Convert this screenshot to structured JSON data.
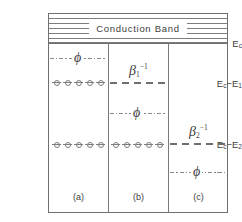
{
  "figure": {
    "type": "energy-band-diagram",
    "conduction_band_label": "Conduction Band",
    "axis_labels": [
      {
        "id": "ec",
        "text": "E",
        "sub": "c",
        "full": "E_c"
      },
      {
        "id": "ec_e1",
        "text": "E",
        "sub": "c",
        "full": "E_c - E_1",
        "minus": "−",
        "t2": "E",
        "sub2": "1"
      },
      {
        "id": "ec_e2",
        "text": "E",
        "sub": "c",
        "full": "E_c - E_2",
        "minus": "−",
        "t2": "E",
        "sub2": "2"
      }
    ],
    "axis_label_texts": {
      "ec": "E",
      "ec_sub": "c",
      "e1_head": "E",
      "e1_head_sub": "c",
      "e1_minus": "−",
      "e1_tail": "E",
      "e1_tail_sub": "1",
      "e2_head": "E",
      "e2_head_sub": "c",
      "e2_minus": "−",
      "e2_tail": "E",
      "e2_tail_sub": "2"
    },
    "panels": [
      {
        "id": "a",
        "caption": "(a)"
      },
      {
        "id": "b",
        "caption": "(b)"
      },
      {
        "id": "c",
        "caption": "(c)"
      }
    ],
    "symbols": {
      "phi": "ϕ",
      "beta": "β",
      "inv": "−1",
      "sub1": "1",
      "sub2": "2"
    },
    "annotations": [
      {
        "id": "phi-a",
        "panel": "a",
        "symbol": "ϕ",
        "line_style": "dash-dot",
        "level": "between Ec and Ec-E1"
      },
      {
        "id": "beta1-b",
        "panel": "b",
        "symbol": "β",
        "sub": "1",
        "sup": "−1",
        "line_style": "dashed",
        "level": "Ec-E1"
      },
      {
        "id": "phi-b",
        "panel": "b",
        "symbol": "ϕ",
        "line_style": "dash-dot",
        "level": "between Ec-E1 and Ec-E2"
      },
      {
        "id": "beta2-c",
        "panel": "c",
        "symbol": "β",
        "sub": "2",
        "sup": "−1",
        "line_style": "dashed",
        "level": "Ec-E2"
      },
      {
        "id": "phi-c",
        "panel": "c",
        "symbol": "ϕ",
        "line_style": "dash-dot",
        "level": "below Ec-E2"
      }
    ],
    "electron_rows": [
      {
        "id": "e1-panel-a",
        "panel": "a",
        "level": "Ec-E1",
        "count": 5
      },
      {
        "id": "e2-panel-a",
        "panel": "a",
        "level": "Ec-E2",
        "count": 5
      },
      {
        "id": "e2-panel-b",
        "panel": "b",
        "level": "Ec-E2",
        "count": 5
      }
    ],
    "hatch_line_count": 6
  }
}
